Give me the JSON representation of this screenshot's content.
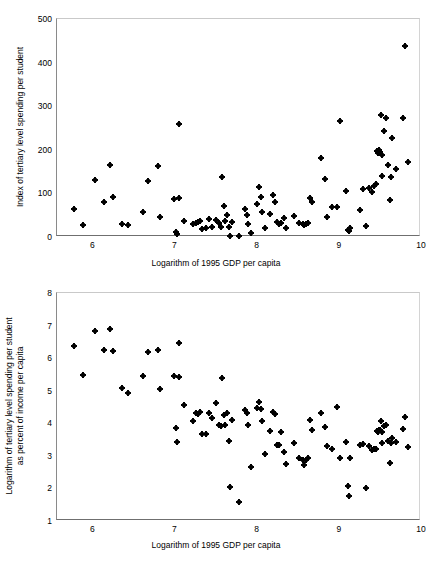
{
  "chart_data": [
    {
      "id": "top",
      "type": "scatter",
      "title": "",
      "xlabel": "Logarithm of 1995 GDP per capita",
      "ylabel": "Index of tertiary level spending per student",
      "ylabel_lines": [
        "Index of tertiary level spending per student"
      ],
      "xlim": [
        5.57,
        10.0
      ],
      "ylim": [
        0,
        500
      ],
      "xticks": [
        6,
        7,
        8,
        9,
        10
      ],
      "xticklabels": [
        "6",
        "7",
        "8",
        "9",
        "10"
      ],
      "yticks": [
        0,
        100,
        200,
        300,
        400,
        500
      ],
      "yticklabels": [
        "0",
        "100",
        "200",
        "300",
        "400",
        "500"
      ],
      "grid": false,
      "legend": null,
      "marker": "diamond",
      "marker_color": "#000000",
      "points": [
        [
          5.78,
          64
        ],
        [
          5.89,
          28
        ],
        [
          6.03,
          131
        ],
        [
          6.14,
          81
        ],
        [
          6.22,
          165
        ],
        [
          6.25,
          92
        ],
        [
          6.36,
          29
        ],
        [
          6.44,
          28
        ],
        [
          6.62,
          57
        ],
        [
          6.68,
          128
        ],
        [
          6.8,
          162
        ],
        [
          6.82,
          47
        ],
        [
          7.0,
          87
        ],
        [
          7.02,
          11
        ],
        [
          7.03,
          6
        ],
        [
          7.05,
          90
        ],
        [
          7.06,
          259
        ],
        [
          7.12,
          36
        ],
        [
          7.23,
          30
        ],
        [
          7.26,
          32
        ],
        [
          7.29,
          34
        ],
        [
          7.31,
          36
        ],
        [
          7.34,
          19
        ],
        [
          7.38,
          21
        ],
        [
          7.42,
          41
        ],
        [
          7.46,
          23
        ],
        [
          7.5,
          39
        ],
        [
          7.54,
          33
        ],
        [
          7.56,
          22
        ],
        [
          7.58,
          137
        ],
        [
          7.6,
          70
        ],
        [
          7.62,
          36
        ],
        [
          7.64,
          50
        ],
        [
          7.66,
          22
        ],
        [
          7.67,
          3
        ],
        [
          7.7,
          35
        ],
        [
          7.78,
          2
        ],
        [
          7.86,
          65
        ],
        [
          7.88,
          51
        ],
        [
          7.9,
          29
        ],
        [
          7.93,
          10
        ],
        [
          8.0,
          76
        ],
        [
          8.03,
          115
        ],
        [
          8.05,
          92
        ],
        [
          8.07,
          57
        ],
        [
          8.1,
          21
        ],
        [
          8.16,
          52
        ],
        [
          8.2,
          97
        ],
        [
          8.22,
          80
        ],
        [
          8.25,
          34
        ],
        [
          8.27,
          30
        ],
        [
          8.3,
          33
        ],
        [
          8.33,
          44
        ],
        [
          8.36,
          20
        ],
        [
          8.46,
          49
        ],
        [
          8.52,
          33
        ],
        [
          8.56,
          29
        ],
        [
          8.58,
          27
        ],
        [
          8.6,
          30
        ],
        [
          8.62,
          33
        ],
        [
          8.65,
          89
        ],
        [
          8.67,
          80
        ],
        [
          8.78,
          182
        ],
        [
          8.83,
          133
        ],
        [
          8.86,
          45
        ],
        [
          8.92,
          68
        ],
        [
          8.98,
          69
        ],
        [
          9.02,
          265
        ],
        [
          9.09,
          105
        ],
        [
          9.11,
          17
        ],
        [
          9.12,
          14
        ],
        [
          9.13,
          21
        ],
        [
          9.26,
          62
        ],
        [
          9.3,
          111
        ],
        [
          9.33,
          25
        ],
        [
          9.37,
          113
        ],
        [
          9.4,
          103
        ],
        [
          9.43,
          116
        ],
        [
          9.45,
          121
        ],
        [
          9.47,
          197
        ],
        [
          9.48,
          192
        ],
        [
          9.49,
          200
        ],
        [
          9.5,
          196
        ],
        [
          9.51,
          280
        ],
        [
          9.52,
          188
        ],
        [
          9.53,
          139
        ],
        [
          9.55,
          243
        ],
        [
          9.58,
          274
        ],
        [
          9.6,
          166
        ],
        [
          9.62,
          84
        ],
        [
          9.63,
          137
        ],
        [
          9.65,
          228
        ],
        [
          9.7,
          156
        ],
        [
          9.78,
          274
        ],
        [
          9.8,
          438
        ],
        [
          9.84,
          171
        ]
      ]
    },
    {
      "id": "bottom",
      "type": "scatter",
      "title": "",
      "xlabel": "Logarithm of 1995 GDP per capita",
      "ylabel": "Logarithm of tertiary level spending per student as percent of income per capita",
      "ylabel_lines": [
        "Logarithm of tertiary level spending per student",
        "as percent of income per capita"
      ],
      "xlim": [
        5.57,
        10.0
      ],
      "ylim": [
        1,
        8
      ],
      "xticks": [
        6,
        7,
        8,
        9,
        10
      ],
      "xticklabels": [
        "6",
        "7",
        "8",
        "9",
        "10"
      ],
      "yticks": [
        1,
        2,
        3,
        4,
        5,
        6,
        7,
        8
      ],
      "yticklabels": [
        "1",
        "2",
        "3",
        "4",
        "5",
        "6",
        "7",
        "8"
      ],
      "grid": false,
      "legend": null,
      "marker": "diamond",
      "marker_color": "#000000",
      "points": [
        [
          5.78,
          6.38
        ],
        [
          5.89,
          5.47
        ],
        [
          6.03,
          6.82
        ],
        [
          6.14,
          6.24
        ],
        [
          6.22,
          6.88
        ],
        [
          6.25,
          6.23
        ],
        [
          6.36,
          5.08
        ],
        [
          6.44,
          4.93
        ],
        [
          6.62,
          5.45
        ],
        [
          6.68,
          6.19
        ],
        [
          6.8,
          6.26
        ],
        [
          6.82,
          5.04
        ],
        [
          7.0,
          5.46
        ],
        [
          7.02,
          3.86
        ],
        [
          7.03,
          3.43
        ],
        [
          7.05,
          5.43
        ],
        [
          7.06,
          6.48
        ],
        [
          7.12,
          4.56
        ],
        [
          7.23,
          4.06
        ],
        [
          7.26,
          4.32
        ],
        [
          7.29,
          4.3
        ],
        [
          7.31,
          4.34
        ],
        [
          7.34,
          3.67
        ],
        [
          7.38,
          3.66
        ],
        [
          7.42,
          4.32
        ],
        [
          7.46,
          4.17
        ],
        [
          7.5,
          4.62
        ],
        [
          7.54,
          3.95
        ],
        [
          7.56,
          3.92
        ],
        [
          7.58,
          5.38
        ],
        [
          7.6,
          4.24
        ],
        [
          7.62,
          3.94
        ],
        [
          7.64,
          4.32
        ],
        [
          7.66,
          3.46
        ],
        [
          7.67,
          2.05
        ],
        [
          7.7,
          4.11
        ],
        [
          7.78,
          1.58
        ],
        [
          7.86,
          4.4
        ],
        [
          7.88,
          4.32
        ],
        [
          7.9,
          3.96
        ],
        [
          7.93,
          2.67
        ],
        [
          8.0,
          4.46
        ],
        [
          8.03,
          4.66
        ],
        [
          8.05,
          4.44
        ],
        [
          8.07,
          4.08
        ],
        [
          8.1,
          3.07
        ],
        [
          8.16,
          3.77
        ],
        [
          8.2,
          4.36
        ],
        [
          8.22,
          4.3
        ],
        [
          8.25,
          3.33
        ],
        [
          8.27,
          3.32
        ],
        [
          8.3,
          3.73
        ],
        [
          8.33,
          3.13
        ],
        [
          8.36,
          2.76
        ],
        [
          8.46,
          3.41
        ],
        [
          8.52,
          2.93
        ],
        [
          8.56,
          2.88
        ],
        [
          8.58,
          2.73
        ],
        [
          8.6,
          2.87
        ],
        [
          8.62,
          2.92
        ],
        [
          8.65,
          4.09
        ],
        [
          8.67,
          3.79
        ],
        [
          8.78,
          4.32
        ],
        [
          8.83,
          3.88
        ],
        [
          8.86,
          3.3
        ],
        [
          8.92,
          3.22
        ],
        [
          8.98,
          4.51
        ],
        [
          9.02,
          2.94
        ],
        [
          9.09,
          3.42
        ],
        [
          9.11,
          2.06
        ],
        [
          9.12,
          1.76
        ],
        [
          9.13,
          2.92
        ],
        [
          9.26,
          3.33
        ],
        [
          9.3,
          3.35
        ],
        [
          9.33,
          2.02
        ],
        [
          9.37,
          3.3
        ],
        [
          9.4,
          3.19
        ],
        [
          9.43,
          3.21
        ],
        [
          9.45,
          3.2
        ],
        [
          9.47,
          3.76
        ],
        [
          9.48,
          3.72
        ],
        [
          9.49,
          3.8
        ],
        [
          9.5,
          3.78
        ],
        [
          9.51,
          4.08
        ],
        [
          9.52,
          3.74
        ],
        [
          9.53,
          3.4
        ],
        [
          9.55,
          3.92
        ],
        [
          9.58,
          3.96
        ],
        [
          9.6,
          3.45
        ],
        [
          9.62,
          2.78
        ],
        [
          9.63,
          3.38
        ],
        [
          9.65,
          3.56
        ],
        [
          9.7,
          3.42
        ],
        [
          9.78,
          3.81
        ],
        [
          9.8,
          4.2
        ],
        [
          9.84,
          3.26
        ]
      ]
    }
  ]
}
